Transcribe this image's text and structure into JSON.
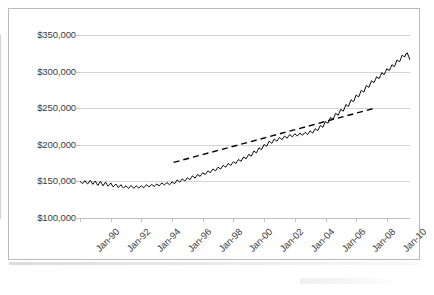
{
  "chart_data": {
    "type": "line",
    "title": "",
    "subtitle": "",
    "xlabel": "",
    "ylabel": "",
    "ylim": [
      100000,
      350000
    ],
    "ytick_labels": [
      "$350,000",
      "$300,000",
      "$250,000",
      "$200,000",
      "$150,000",
      "$100,000"
    ],
    "ytick_values": [
      350000,
      300000,
      250000,
      200000,
      150000,
      100000
    ],
    "xtick_labels": [
      "Jan-90",
      "Jan-92",
      "Jan-94",
      "Jan-96",
      "Jan-98",
      "Jan-00",
      "Jan-02",
      "Jan-04",
      "Jan-06",
      "Jan-08",
      "Jan-10"
    ],
    "xtick_values": [
      1990,
      1992,
      1994,
      1996,
      1998,
      2000,
      2002,
      2004,
      2006,
      2008,
      2010
    ],
    "xlim": [
      1990,
      2011.5
    ],
    "grid": "horizontal",
    "legend": "none",
    "series": [
      {
        "name": "Median home price",
        "style": "solid",
        "color": "#000000",
        "x_start": 1990.0,
        "x_step": 0.0833,
        "values": [
          150000,
          148500,
          147000,
          149500,
          151000,
          148000,
          146500,
          149000,
          151500,
          149000,
          146000,
          148500,
          150500,
          147000,
          144500,
          147500,
          150000,
          147000,
          144000,
          146500,
          149000,
          146000,
          143500,
          145500,
          148000,
          145000,
          142500,
          144500,
          146500,
          144000,
          141500,
          143500,
          145500,
          143000,
          141000,
          142500,
          144000,
          142000,
          140500,
          142500,
          144500,
          142500,
          140500,
          142000,
          144000,
          142500,
          141000,
          142500,
          144000,
          142500,
          141500,
          143500,
          145500,
          144000,
          142500,
          144000,
          146000,
          144500,
          143000,
          144500,
          146500,
          145000,
          144000,
          146000,
          148000,
          146500,
          145000,
          146500,
          148500,
          147000,
          145500,
          147000,
          149500,
          148000,
          147000,
          149500,
          152000,
          150500,
          149000,
          151000,
          153500,
          152000,
          150500,
          152500,
          155000,
          153500,
          152500,
          155000,
          157500,
          156000,
          154500,
          157000,
          159500,
          158000,
          157000,
          159500,
          162000,
          160500,
          159500,
          162000,
          164500,
          163000,
          162000,
          164500,
          167000,
          165500,
          164500,
          167000,
          169500,
          168000,
          167000,
          169500,
          172000,
          170500,
          169500,
          172000,
          174500,
          173000,
          172000,
          174500,
          177000,
          175500,
          174500,
          177500,
          180000,
          178500,
          177500,
          180500,
          183500,
          182000,
          181000,
          184000,
          187000,
          185500,
          184500,
          188000,
          191500,
          190000,
          189000,
          192500,
          196000,
          194500,
          193500,
          197000,
          200500,
          199000,
          198000,
          201500,
          205000,
          203500,
          202000,
          205000,
          208000,
          206500,
          205000,
          207500,
          210000,
          208500,
          207000,
          209500,
          212000,
          210500,
          209000,
          211500,
          214000,
          212500,
          211000,
          213000,
          215000,
          213500,
          212000,
          214000,
          216000,
          214500,
          213000,
          215000,
          217000,
          215500,
          214000,
          216500,
          219000,
          217500,
          216000,
          219000,
          222000,
          220500,
          219500,
          223000,
          226500,
          225000,
          224000,
          228000,
          232000,
          230500,
          229500,
          233500,
          237500,
          236000,
          235000,
          239000,
          243000,
          241500,
          240500,
          244500,
          248500,
          247000,
          246000,
          250500,
          255000,
          253500,
          252500,
          257000,
          261500,
          260000,
          259000,
          263500,
          268000,
          266500,
          265500,
          270000,
          274500,
          273000,
          272000,
          276500,
          281000,
          279500,
          278500,
          283000,
          287500,
          286000,
          285000,
          289000,
          293000,
          291500,
          290500,
          294500,
          298500,
          297000,
          296000,
          300000,
          304000,
          302500,
          301500,
          305500,
          309500,
          308000,
          307000,
          311500,
          316000,
          314500,
          313500,
          318000,
          322500,
          321000,
          320000,
          324500,
          325500,
          321000,
          316500,
          313000,
          309500,
          311000,
          312500,
          309000,
          305500,
          302000,
          298500,
          301000,
          303500,
          300000,
          296500,
          291000,
          285500,
          280000,
          274500,
          269000,
          263500,
          258000,
          252500,
          247000,
          252000,
          257000,
          262000,
          267000,
          272000,
          267000,
          262000,
          257000,
          262000,
          267000,
          272000,
          267000,
          262000,
          257000,
          262000,
          267000,
          272000,
          267000,
          262000,
          257000,
          262000,
          267000,
          272000,
          267000,
          262000,
          257000,
          252000,
          257000,
          262000,
          267000,
          262000,
          257000,
          252000,
          257000,
          262000,
          257000,
          252000,
          257000,
          262000,
          257000,
          252000,
          257000,
          262000,
          258000
        ]
      },
      {
        "name": "Trendline",
        "style": "dashed",
        "color": "#000000",
        "points": [
          {
            "x": 1996.1,
            "y": 176000
          },
          {
            "x": 2009.2,
            "y": 250000
          }
        ]
      }
    ],
    "annotations": []
  }
}
